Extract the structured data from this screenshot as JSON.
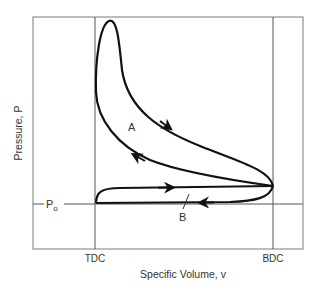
{
  "diagram": {
    "type": "pv-diagram",
    "title": "",
    "x_axis_label": "Specific Volume, v",
    "y_axis_label": "Pressure, P",
    "x_markers": [
      {
        "id": "tdc",
        "label": "TDC"
      },
      {
        "id": "bdc",
        "label": "BDC"
      }
    ],
    "y_markers": [
      {
        "id": "p0",
        "label": "P",
        "subscript": "o"
      }
    ],
    "regions": [
      {
        "id": "A",
        "label": "A",
        "description": "power loop (compression/expansion)"
      },
      {
        "id": "B",
        "label": "B",
        "description": "pumping loop (intake/exhaust)"
      }
    ],
    "colors": {
      "frame": "#7a7a7a",
      "curve": "#111111",
      "text": "#333333"
    }
  }
}
